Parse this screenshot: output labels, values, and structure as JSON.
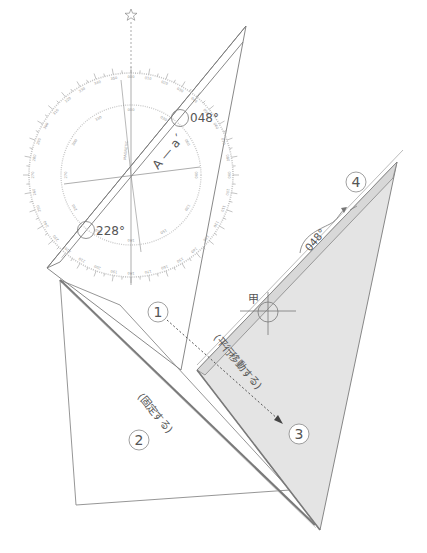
{
  "diagram": {
    "compass": {
      "center_marker": "star-icon",
      "outer_ring_labels": [
        "000",
        "010",
        "020",
        "030",
        "040",
        "050",
        "060",
        "070",
        "080",
        "090",
        "100",
        "110",
        "120",
        "130",
        "140",
        "150",
        "160",
        "170",
        "180",
        "190",
        "200",
        "210",
        "220",
        "230",
        "240",
        "250",
        "260",
        "270",
        "280",
        "290",
        "300",
        "310",
        "320",
        "330",
        "340",
        "350"
      ],
      "inner_label": "MAGNETIC",
      "bearing_forward": "048°",
      "bearing_reverse": "228°",
      "course_line_label": "A — a´"
    },
    "steps": [
      {
        "number": "1"
      },
      {
        "number": "2",
        "note": "(固定する)"
      },
      {
        "number": "3"
      },
      {
        "number": "4"
      }
    ],
    "move_note": "(平行移動する)",
    "point_label": "甲",
    "result_bearing": "048°",
    "colors": {
      "line": "#6e6e6e",
      "ring": "#bdbdbd",
      "shaded": "#e4e4e4",
      "text": "#555555"
    }
  }
}
